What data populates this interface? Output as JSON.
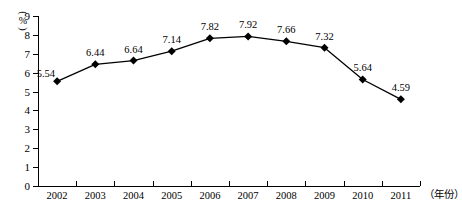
{
  "chart_data": {
    "type": "line",
    "title": "",
    "xlabel": "(年份)",
    "ylabel": "(%)",
    "categories": [
      "2002",
      "2003",
      "2004",
      "2005",
      "2006",
      "2007",
      "2008",
      "2009",
      "2010",
      "2011"
    ],
    "values": [
      5.54,
      6.44,
      6.64,
      7.14,
      7.82,
      7.92,
      7.66,
      7.32,
      5.64,
      4.59
    ],
    "value_labels": [
      "5.54",
      "6.44",
      "6.64",
      "7.14",
      "7.82",
      "7.92",
      "7.66",
      "7.32",
      "5.64",
      "4.59"
    ],
    "ylim": [
      0,
      9
    ],
    "y_ticks": [
      "0",
      "1",
      "2",
      "3",
      "4",
      "5",
      "6",
      "7",
      "8",
      "9"
    ],
    "grid": false,
    "legend": "none",
    "marker": "diamond",
    "series": [
      {
        "name": "",
        "values": [
          5.54,
          6.44,
          6.64,
          7.14,
          7.82,
          7.92,
          7.66,
          7.32,
          5.64,
          4.59
        ]
      }
    ]
  },
  "style": {
    "line_color": "#000000",
    "marker_color": "#000000",
    "axis_color": "#000000",
    "background": "#ffffff",
    "text_color": "#000000"
  },
  "axis_units": {
    "y_paren_open": "(",
    "y_percent": "%",
    "y_paren_close": ")",
    "x_caption": "（年份）"
  }
}
